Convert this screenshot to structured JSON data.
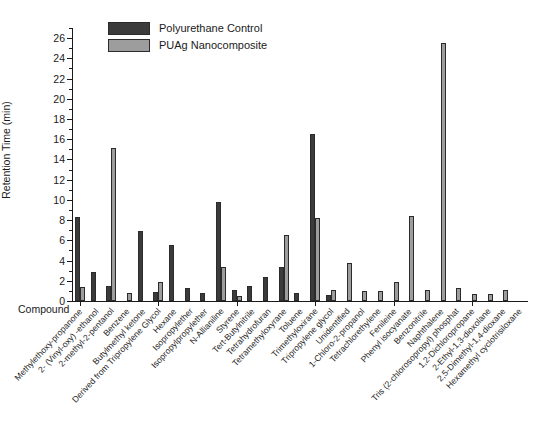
{
  "axis": {
    "ylabel": "Retention Time (min)",
    "xlabel": "Compound",
    "yticks": [
      "0",
      "2",
      "4",
      "6",
      "8",
      "10",
      "12",
      "14",
      "16",
      "18",
      "20",
      "22",
      "24",
      "26"
    ]
  },
  "legend": {
    "items": [
      {
        "label": "Polyurethane Control",
        "color": "#3b3b3b"
      },
      {
        "label": "PUAg Nanocomposite",
        "color": "#9d9d9d"
      }
    ]
  },
  "chart_data": {
    "type": "bar",
    "title": "",
    "xlabel": "Compound",
    "ylabel": "Retention Time (min)",
    "ylim": [
      0,
      27
    ],
    "grid": false,
    "legend_position": "top-left",
    "categories": [
      "Methylethoxy-propanone",
      "2- (Vinyl-oxy) -ethanol",
      "2-methyl-2-pentanol",
      "Benzene",
      "Butylmethyl ketone",
      "Derived from Tripropylene Glycol",
      "Hexane",
      "Isopropylether",
      "Isopropylpropylether",
      "N-Allianiline",
      "Styrene",
      "Tert-Butylnitrile",
      "Tetrahydrofuran",
      "Tetramethyloxyrane",
      "Toluene",
      "Trimethyloxirane",
      "Tripropylene glycol",
      "Unidentified",
      "1-Chloro-2-propanol",
      "Tetrachlorethylene",
      "Fenileine",
      "Phenyl isocyanate",
      "Benzonitrile",
      "Naphthalene",
      "Tris (2-chlorosopropyl) phosphat",
      "1,2-Dichloropropane",
      "2-Ethyl-1,3-dioxolane",
      "2,5-Dimethyl-1,4-dioxane",
      "Hexamethyl cyclotrisiloxane"
    ],
    "series": [
      {
        "name": "Polyurethane Control",
        "color": "#3b3b3b",
        "values": [
          8.3,
          0,
          2.9,
          0,
          1.45,
          0,
          0,
          6.9,
          0.9,
          0,
          1.25,
          0.8,
          9.8,
          0,
          0,
          1.5,
          2.4,
          0,
          3.4,
          0,
          16.5,
          0.55,
          0,
          0,
          0,
          0,
          0,
          0,
          0
        ]
      },
      {
        "name": "PUAg Nanocomposite",
        "color": "#9d9d9d",
        "values": [
          1.35,
          0,
          0,
          0,
          15.1,
          0.8,
          0,
          0,
          1.9,
          0,
          0,
          0,
          3.4,
          1.05,
          0.5,
          0,
          4.3,
          0.65,
          0,
          6.5,
          8.2,
          1.1,
          3.8,
          0,
          1.0,
          0,
          8.4,
          25.5,
          0.9
        ]
      }
    ],
    "bars_by_category": [
      {
        "label": "Methylethoxy-propanone",
        "control": 8.3,
        "nanocomposite": 1.35
      },
      {
        "label": "2- (Vinyl-oxy) -ethanol",
        "control": 2.9,
        "nanocomposite": 0
      },
      {
        "label": "2-methyl-2-pentanol",
        "control": 1.45,
        "nanocomposite": 15.1
      },
      {
        "label": "Benzene",
        "control": 0,
        "nanocomposite": 0.8
      },
      {
        "label": "Butylmethyl ketone",
        "control": 6.9,
        "nanocomposite": 0
      },
      {
        "label": "Derived from Tripropylene Glycol",
        "control": 0.9,
        "nanocomposite": 1.9
      },
      {
        "label": "Hexane",
        "control": 5.55,
        "nanocomposite": 0
      },
      {
        "label": "Isopropylether",
        "control": 1.25,
        "nanocomposite": 0
      },
      {
        "label": "Isopropylpropylether",
        "control": 0.8,
        "nanocomposite": 0
      },
      {
        "label": "N-Allianiline",
        "control": 9.8,
        "nanocomposite": 3.4
      },
      {
        "label": "Styrene",
        "control": 1.05,
        "nanocomposite": 0.5
      },
      {
        "label": "Tert-Butylnitrile",
        "control": 1.5,
        "nanocomposite": 0
      },
      {
        "label": "Tetrahydrofuran",
        "control": 2.4,
        "nanocomposite": 0
      },
      {
        "label": "Tetramethyloxyrane",
        "control": 3.4,
        "nanocomposite": 6.5
      },
      {
        "label": "Toluene",
        "control": 0.75,
        "nanocomposite": 0
      },
      {
        "label": "Trimethyloxirane",
        "control": 16.5,
        "nanocomposite": 8.2
      },
      {
        "label": "Tripropylene glycol",
        "control": 0.55,
        "nanocomposite": 1.1
      },
      {
        "label": "Unidentified",
        "control": 0,
        "nanocomposite": 3.8
      },
      {
        "label": "1-Chloro-2-propanol",
        "control": 0,
        "nanocomposite": 1.0
      },
      {
        "label": "Tetrachlorethylene",
        "control": 0,
        "nanocomposite": 1.0
      },
      {
        "label": "Fenileine",
        "control": 0,
        "nanocomposite": 1.9
      },
      {
        "label": "Phenyl isocyanate",
        "control": 0,
        "nanocomposite": 8.4
      },
      {
        "label": "Benzonitrile",
        "control": 0,
        "nanocomposite": 1.1
      },
      {
        "label": "Naphthalene",
        "control": 0,
        "nanocomposite": 25.5
      },
      {
        "label": "Tris (2-chlorosopropyl) phosphat",
        "control": 0,
        "nanocomposite": 1.3
      },
      {
        "label": "1,2-Dichloropropane",
        "control": 0,
        "nanocomposite": 0.7
      },
      {
        "label": "2-Ethyl-1,3-dioxolane",
        "control": 0,
        "nanocomposite": 0.65
      },
      {
        "label": "2,5-Dimethyl-1,4-dioxane",
        "control": 0,
        "nanocomposite": 1.1
      },
      {
        "label": "Hexamethyl cyclotrisiloxane",
        "control": 0,
        "nanocomposite": 0
      }
    ]
  }
}
